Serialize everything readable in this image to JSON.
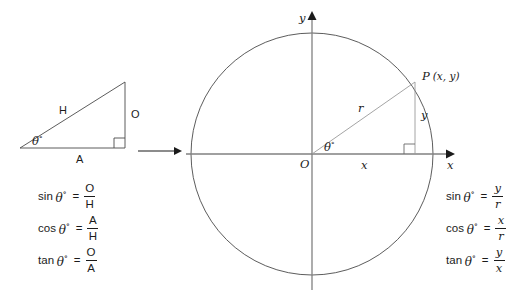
{
  "figure": {
    "stroke_color": "#4a4a4a",
    "axis_color": "#808080",
    "text_color": "#1b1b1b"
  },
  "triangle": {
    "hypotenuse_label": "H",
    "opposite_label": "O",
    "adjacent_label": "A",
    "angle_label": "θ",
    "angle_degree_symbol": "°",
    "right_angle_marker": "right-angle"
  },
  "transition": {
    "arrow": "→"
  },
  "circle": {
    "origin_label": "O",
    "x_axis_label": "x",
    "y_axis_label": "y",
    "radius_label": "r",
    "point_label": "P",
    "point_coords": "(x, y)",
    "vertical_leg_label": "y",
    "horizontal_leg_label": "x",
    "angle_label": "θ",
    "angle_degree_symbol": "°"
  },
  "formulas_left": [
    {
      "fn": "sin",
      "arg": "θ",
      "deg": "°",
      "eq": "=",
      "num": "O",
      "den": "H"
    },
    {
      "fn": "cos",
      "arg": "θ",
      "deg": "°",
      "eq": "=",
      "num": "A",
      "den": "H"
    },
    {
      "fn": "tan",
      "arg": "θ",
      "deg": "°",
      "eq": "=",
      "num": "O",
      "den": "A"
    }
  ],
  "formulas_right": [
    {
      "fn": "sin",
      "arg": "θ",
      "deg": "°",
      "eq": "=",
      "num": "y",
      "den": "r"
    },
    {
      "fn": "cos",
      "arg": "θ",
      "deg": "°",
      "eq": "=",
      "num": "x",
      "den": "r"
    },
    {
      "fn": "tan",
      "arg": "θ",
      "deg": "°",
      "eq": "=",
      "num": "y",
      "den": "x"
    }
  ]
}
